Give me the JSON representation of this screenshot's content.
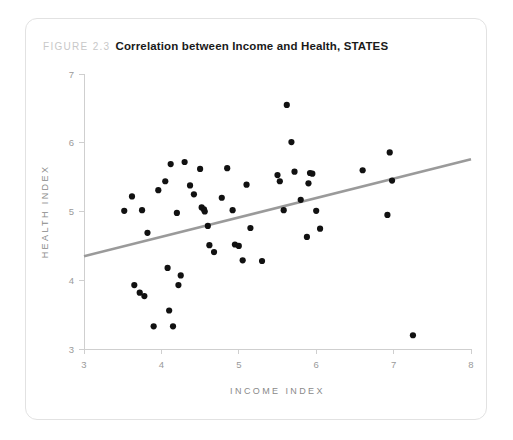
{
  "figure": {
    "label": "FIGURE 2.3",
    "title": "Correlation between Income and Health, STATES"
  },
  "colors": {
    "card_border": "#e2e2e2",
    "axis": "#cfcfcf",
    "tick_text": "#9a9a9a",
    "axis_caption": "#8a8a8a",
    "point": "#111111",
    "trendline": "#9a9a9a",
    "caption_label": "#c8c8c8",
    "caption_title": "#1a1a1a",
    "background": "#ffffff"
  },
  "chart_data": {
    "type": "scatter",
    "title": "Correlation between Income and Health, STATES",
    "xlabel": "INCOME INDEX",
    "ylabel": "HEALTH INDEX",
    "xlim": [
      3,
      8
    ],
    "ylim": [
      3,
      7
    ],
    "xticks": [
      3,
      4,
      5,
      6,
      7,
      8
    ],
    "yticks": [
      3,
      4,
      5,
      6,
      7
    ],
    "grid": false,
    "legend": "none",
    "series": [
      {
        "name": "States",
        "marker": "circle",
        "points": [
          [
            3.52,
            5.01
          ],
          [
            3.62,
            5.22
          ],
          [
            3.65,
            3.93
          ],
          [
            3.72,
            3.82
          ],
          [
            3.75,
            5.02
          ],
          [
            3.78,
            3.77
          ],
          [
            3.82,
            4.69
          ],
          [
            3.9,
            3.33
          ],
          [
            3.96,
            5.31
          ],
          [
            4.05,
            5.44
          ],
          [
            4.08,
            4.18
          ],
          [
            4.1,
            3.56
          ],
          [
            4.12,
            5.69
          ],
          [
            4.15,
            3.33
          ],
          [
            4.2,
            4.98
          ],
          [
            4.22,
            3.93
          ],
          [
            4.25,
            4.07
          ],
          [
            4.3,
            5.72
          ],
          [
            4.37,
            5.38
          ],
          [
            4.42,
            5.25
          ],
          [
            4.5,
            5.62
          ],
          [
            4.52,
            5.06
          ],
          [
            4.55,
            5.03
          ],
          [
            4.56,
            5.0
          ],
          [
            4.6,
            4.79
          ],
          [
            4.62,
            4.51
          ],
          [
            4.68,
            4.41
          ],
          [
            4.78,
            5.2
          ],
          [
            4.85,
            5.63
          ],
          [
            4.92,
            5.02
          ],
          [
            4.95,
            4.52
          ],
          [
            5.0,
            4.5
          ],
          [
            5.05,
            4.29
          ],
          [
            5.1,
            5.39
          ],
          [
            5.15,
            4.76
          ],
          [
            5.3,
            4.28
          ],
          [
            5.5,
            5.53
          ],
          [
            5.53,
            5.44
          ],
          [
            5.58,
            5.02
          ],
          [
            5.62,
            6.55
          ],
          [
            5.68,
            6.01
          ],
          [
            5.72,
            5.58
          ],
          [
            5.8,
            5.17
          ],
          [
            5.88,
            4.63
          ],
          [
            5.9,
            5.41
          ],
          [
            5.92,
            5.56
          ],
          [
            5.95,
            5.55
          ],
          [
            6.0,
            5.01
          ],
          [
            6.05,
            4.75
          ],
          [
            6.6,
            5.6
          ],
          [
            6.95,
            5.86
          ],
          [
            6.98,
            5.45
          ],
          [
            6.92,
            4.95
          ],
          [
            7.25,
            3.2
          ]
        ]
      }
    ],
    "trendline": {
      "name": "linear fit",
      "x_start": 3.0,
      "y_start": 4.35,
      "x_end": 8.0,
      "y_end": 5.76
    }
  }
}
